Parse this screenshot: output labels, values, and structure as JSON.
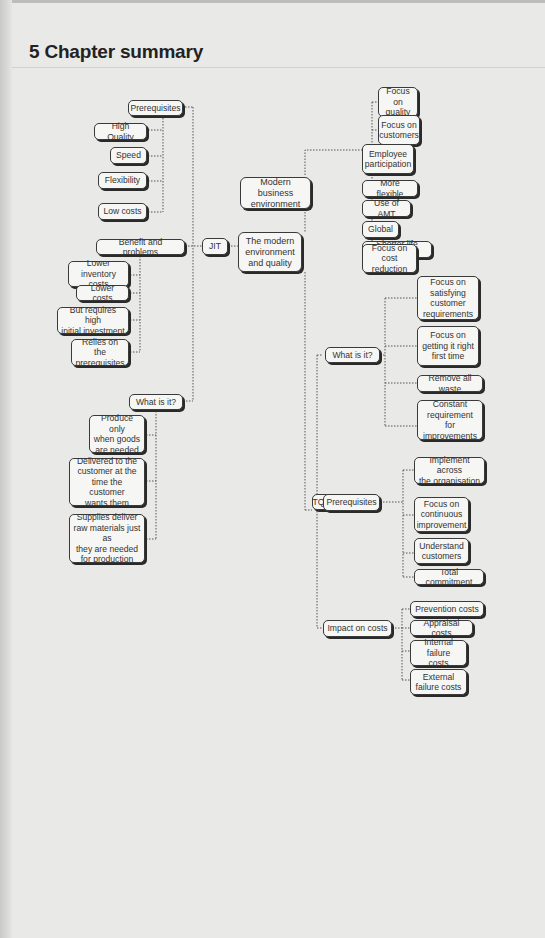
{
  "page": {
    "title": "5 Chapter summary"
  },
  "diagram": {
    "root": "The modern\nenvironment\nand quality",
    "modern_business": {
      "label": "Modern business\nenvironment",
      "children": [
        "Focus on\nquality",
        "Focus on\ncustomers",
        "Employee\nparticipation",
        "More flexible",
        "Use of AMT",
        "Global",
        "Shorter life cycle",
        "Focus on\ncost reduction"
      ]
    },
    "jit": {
      "label": "JIT",
      "prerequisites": {
        "label": "Prerequisites",
        "children": [
          "High Quality",
          "Speed",
          "Flexibility",
          "Low costs"
        ]
      },
      "benefits": {
        "label": "Benefit and problems",
        "children": [
          "Lower inventory\ncosts",
          "Lower costs",
          "But requires high\ninitial investment",
          "Relies on the\nprerequisites"
        ]
      },
      "what_is_it": {
        "label": "What is it?",
        "children": [
          "Produce only\nwhen goods\nare needed",
          "Delivered to the\ncustomer at the\ntime the customer\nwants them",
          "Supplies deliver\nraw materials just as\nthey are needed\nfor production"
        ]
      }
    },
    "tqm": {
      "label": "TQM",
      "what_is_it": {
        "label": "What is it?",
        "children": [
          "Focus on\nsatisfying\ncustomer\nrequirements",
          "Focus on\ngetting it right\nfirst time",
          "Remove all waste",
          "Constant\nrequirement\nfor improvements"
        ]
      },
      "prerequisites": {
        "label": "Prerequisites",
        "children": [
          "Implement\nacross\nthe organisation",
          "Focus on\ncontinuous\nimprovement",
          "Understand\ncustomers",
          "Total commitment"
        ]
      },
      "impact": {
        "label": "Impact on costs",
        "children": [
          "Prevention costs",
          "Appraisal costs",
          "Internal failure\ncosts",
          "External\nfailure costs"
        ]
      }
    }
  }
}
